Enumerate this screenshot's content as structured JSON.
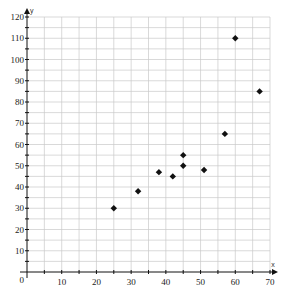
{
  "chart_data": {
    "type": "scatter",
    "title": "",
    "xlabel": "x",
    "ylabel": "y",
    "xlim": [
      0,
      70
    ],
    "ylim": [
      0,
      120
    ],
    "grid": true,
    "grid_step_x": 5,
    "grid_step_y": 5,
    "x_ticks": [
      0,
      10,
      20,
      30,
      40,
      50,
      60,
      70
    ],
    "y_ticks": [
      10,
      20,
      30,
      40,
      50,
      60,
      70,
      80,
      90,
      100,
      110,
      120
    ],
    "origin_label": "0",
    "marker": "diamond",
    "marker_color": "#111111",
    "points": [
      {
        "x": 25,
        "y": 30
      },
      {
        "x": 32,
        "y": 38
      },
      {
        "x": 38,
        "y": 47
      },
      {
        "x": 42,
        "y": 45
      },
      {
        "x": 45,
        "y": 50
      },
      {
        "x": 45,
        "y": 55
      },
      {
        "x": 51,
        "y": 48
      },
      {
        "x": 57,
        "y": 65
      },
      {
        "x": 60,
        "y": 110
      },
      {
        "x": 67,
        "y": 85
      }
    ]
  }
}
